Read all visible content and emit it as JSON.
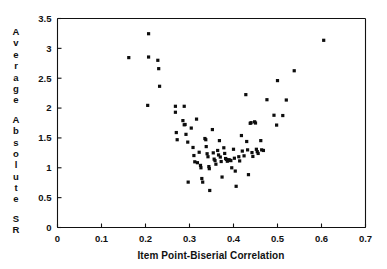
{
  "chart_data": {
    "type": "scatter",
    "title": "",
    "xlabel": "Item Point-Biserial Correlation",
    "ylabel": "Average Absolute SR",
    "ylabel_chars": [
      "A",
      "v",
      "e",
      "r",
      "a",
      "g",
      "e",
      "",
      "A",
      "b",
      "s",
      "o",
      "l",
      "u",
      "t",
      "e",
      "",
      "S",
      "R"
    ],
    "xlim": [
      0,
      0.7
    ],
    "ylim": [
      0,
      3.5
    ],
    "xticks": [
      0,
      0.1,
      0.2,
      0.3,
      0.4,
      0.5,
      0.6,
      0.7
    ],
    "xtick_labels": [
      "0",
      "0.1",
      "0.2",
      "0.3",
      "0.4",
      "0.5",
      "0.6",
      "0.7"
    ],
    "yticks": [
      0,
      0.5,
      1,
      1.5,
      2,
      2.5,
      3,
      3.5
    ],
    "ytick_labels": [
      "0",
      "0.5",
      "1",
      "1.5",
      "2",
      "2.5",
      "3",
      "3.5"
    ],
    "grid": false,
    "legend": "none",
    "marker": "square",
    "marker_color": "#0d0d0d",
    "marker_size_px": 3.2,
    "points": [
      [
        0.162,
        2.845
      ],
      [
        0.207,
        3.245
      ],
      [
        0.207,
        2.855
      ],
      [
        0.205,
        2.045
      ],
      [
        0.228,
        2.8
      ],
      [
        0.23,
        2.66
      ],
      [
        0.232,
        2.365
      ],
      [
        0.268,
        2.03
      ],
      [
        0.268,
        1.93
      ],
      [
        0.27,
        1.59
      ],
      [
        0.272,
        1.47
      ],
      [
        0.288,
        2.03
      ],
      [
        0.285,
        1.79
      ],
      [
        0.288,
        1.72
      ],
      [
        0.29,
        1.725
      ],
      [
        0.292,
        1.56
      ],
      [
        0.296,
        1.43
      ],
      [
        0.297,
        0.76
      ],
      [
        0.304,
        1.665
      ],
      [
        0.308,
        1.34
      ],
      [
        0.31,
        1.205
      ],
      [
        0.312,
        1.1
      ],
      [
        0.316,
        1.815
      ],
      [
        0.318,
        1.085
      ],
      [
        0.322,
        1.26
      ],
      [
        0.325,
        1.04
      ],
      [
        0.326,
        1.0
      ],
      [
        0.328,
        0.82
      ],
      [
        0.33,
        0.76
      ],
      [
        0.335,
        1.49
      ],
      [
        0.337,
        1.47
      ],
      [
        0.338,
        1.355
      ],
      [
        0.34,
        1.235
      ],
      [
        0.342,
        1.185
      ],
      [
        0.344,
        1.02
      ],
      [
        0.345,
        0.985
      ],
      [
        0.346,
        0.62
      ],
      [
        0.352,
        1.64
      ],
      [
        0.354,
        1.25
      ],
      [
        0.356,
        1.145
      ],
      [
        0.358,
        1.12
      ],
      [
        0.36,
        1.06
      ],
      [
        0.364,
        1.29
      ],
      [
        0.366,
        1.215
      ],
      [
        0.368,
        1.455
      ],
      [
        0.37,
        1.18
      ],
      [
        0.372,
        1.105
      ],
      [
        0.374,
        0.845
      ],
      [
        0.378,
        1.335
      ],
      [
        0.38,
        1.24
      ],
      [
        0.382,
        1.155
      ],
      [
        0.384,
        1.14
      ],
      [
        0.386,
        1.11
      ],
      [
        0.39,
        1.135
      ],
      [
        0.392,
        1.125
      ],
      [
        0.394,
        1.12
      ],
      [
        0.396,
        1.0
      ],
      [
        0.4,
        1.31
      ],
      [
        0.402,
        1.16
      ],
      [
        0.404,
        0.945
      ],
      [
        0.406,
        0.69
      ],
      [
        0.412,
        1.185
      ],
      [
        0.414,
        1.115
      ],
      [
        0.418,
        1.54
      ],
      [
        0.42,
        1.28
      ],
      [
        0.424,
        1.2
      ],
      [
        0.428,
        2.225
      ],
      [
        0.43,
        1.44
      ],
      [
        0.432,
        1.3
      ],
      [
        0.434,
        0.885
      ],
      [
        0.438,
        1.745
      ],
      [
        0.44,
        1.755
      ],
      [
        0.442,
        1.255
      ],
      [
        0.444,
        1.19
      ],
      [
        0.448,
        1.77
      ],
      [
        0.45,
        1.75
      ],
      [
        0.452,
        1.31
      ],
      [
        0.454,
        1.27
      ],
      [
        0.456,
        1.24
      ],
      [
        0.462,
        1.455
      ],
      [
        0.464,
        1.3
      ],
      [
        0.468,
        1.29
      ],
      [
        0.476,
        2.14
      ],
      [
        0.492,
        1.88
      ],
      [
        0.498,
        1.715
      ],
      [
        0.5,
        2.46
      ],
      [
        0.512,
        1.875
      ],
      [
        0.52,
        2.135
      ],
      [
        0.538,
        2.625
      ],
      [
        0.605,
        3.135
      ]
    ]
  }
}
